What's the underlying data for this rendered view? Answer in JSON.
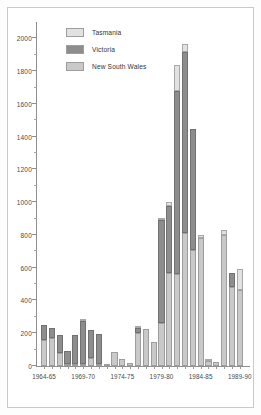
{
  "chart_data": {
    "type": "bar",
    "subtype": "stacked",
    "title": "",
    "xlabel": "",
    "ylabel": "",
    "ylim": [
      0,
      2100
    ],
    "ytick_labels": [
      "0",
      "200",
      "400",
      "600",
      "800",
      "1000",
      "1200",
      "1400",
      "1600",
      "1800",
      "2000"
    ],
    "ytick_values": [
      0,
      200,
      400,
      600,
      800,
      1000,
      1200,
      1400,
      1600,
      1800,
      2000
    ],
    "yminor_step": 100,
    "grid": false,
    "legend_position": "top-left",
    "series": [
      {
        "name": "New South Wales",
        "color": "#c9c9c9",
        "values": [
          160,
          170,
          80,
          10,
          10,
          10,
          50,
          10,
          5,
          85,
          40,
          20,
          200,
          225,
          145,
          265,
          565,
          560,
          815,
          710,
          780,
          30,
          25,
          800,
          480,
          465
        ]
      },
      {
        "name": "Victoria",
        "color": "#8d8d8d",
        "values": [
          90,
          65,
          110,
          80,
          175,
          260,
          170,
          185,
          0,
          0,
          0,
          0,
          30,
          0,
          0,
          625,
          410,
          1120,
          1100,
          735,
          0,
          0,
          0,
          0,
          90,
          0
        ]
      },
      {
        "name": "Tasmania",
        "color": "#e2e2e2",
        "values": [
          0,
          0,
          0,
          0,
          0,
          5,
          0,
          0,
          0,
          0,
          0,
          0,
          10,
          0,
          0,
          10,
          25,
          160,
          50,
          0,
          20,
          5,
          0,
          30,
          0,
          130
        ]
      }
    ],
    "categories": [
      "1964-65",
      "1965-66",
      "1966-67",
      "1967-68",
      "1968-69",
      "1969-70",
      "1970-71",
      "1971-72",
      "1972-73",
      "1973-74",
      "1974-75",
      "1975-76",
      "1976-77",
      "1977-78",
      "1978-79",
      "1979-80",
      "1980-81",
      "1981-82",
      "1982-83",
      "1983-84",
      "1984-85",
      "1985-86",
      "1986-87",
      "1987-88",
      "1988-89",
      "1989-90"
    ],
    "xtick_labels": [
      "1964-65",
      "1969-70",
      "1974-75",
      "1979-80",
      "1984-85",
      "1989-90"
    ],
    "xtick_indices": [
      0,
      5,
      10,
      15,
      20,
      25
    ],
    "totals": [
      250,
      235,
      190,
      90,
      185,
      275,
      220,
      195,
      5,
      85,
      40,
      20,
      240,
      225,
      145,
      900,
      1000,
      1840,
      1965,
      1445,
      800,
      35,
      25,
      830,
      570,
      595
    ]
  },
  "legend": {
    "items": [
      {
        "label": "Tasmania",
        "color": "#e2e2e2"
      },
      {
        "label": "Victoria",
        "color": "#8d8d8d"
      },
      {
        "label": "New South Wales",
        "color": "#c9c9c9"
      }
    ]
  }
}
